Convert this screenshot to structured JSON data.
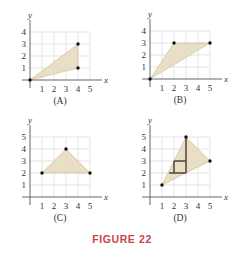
{
  "figure": {
    "caption": "FIGURE 22",
    "colors": {
      "fill": "#e6dcc0",
      "fill_edge": "#c9b88a",
      "grid": "#d8d8d8",
      "axis": "#555555",
      "point": "#111111",
      "inner_lines": "#5a4a3a",
      "caption": "#c8464a"
    },
    "panels": [
      {
        "label": "(A)",
        "origin": [
          30,
          80
        ],
        "grid_x": 5,
        "grid_y": 4,
        "x_ticks": [
          "1",
          "2",
          "3",
          "4",
          "5"
        ],
        "y_ticks": [
          "1",
          "2",
          "3",
          "4"
        ],
        "x_axis_label": "x",
        "y_axis_label": "y",
        "polygon": [
          [
            0,
            0
          ],
          [
            4,
            3
          ],
          [
            4,
            1
          ]
        ],
        "points": [
          [
            0,
            0
          ],
          [
            4,
            3
          ],
          [
            4,
            1
          ]
        ],
        "inner_lines": []
      },
      {
        "label": "(B)",
        "origin": [
          150,
          79
        ],
        "grid_x": 5,
        "grid_y": 4,
        "x_ticks": [
          "1",
          "2",
          "3",
          "4",
          "5"
        ],
        "y_ticks": [
          "1",
          "2",
          "3",
          "4"
        ],
        "x_axis_label": "x",
        "y_axis_label": "y",
        "polygon": [
          [
            0,
            0
          ],
          [
            2,
            3
          ],
          [
            5,
            3
          ]
        ],
        "points": [
          [
            0,
            0
          ],
          [
            2,
            3
          ],
          [
            5,
            3
          ]
        ],
        "inner_lines": []
      },
      {
        "label": "(C)",
        "origin": [
          30,
          197
        ],
        "grid_x": 5,
        "grid_y": 5,
        "x_ticks": [
          "1",
          "2",
          "3",
          "4",
          "5"
        ],
        "y_ticks": [
          "1",
          "2",
          "3",
          "4",
          "5"
        ],
        "x_axis_label": "x",
        "y_axis_label": "y",
        "polygon": [
          [
            1,
            2
          ],
          [
            3,
            4
          ],
          [
            5,
            2
          ]
        ],
        "points": [
          [
            1,
            2
          ],
          [
            3,
            4
          ],
          [
            5,
            2
          ]
        ],
        "inner_lines": []
      },
      {
        "label": "(D)",
        "origin": [
          150,
          197
        ],
        "grid_x": 5,
        "grid_y": 5,
        "x_ticks": [
          "1",
          "2",
          "3",
          "4",
          "5"
        ],
        "y_ticks": [
          "1",
          "2",
          "3",
          "4",
          "5"
        ],
        "x_axis_label": "x",
        "y_axis_label": "y",
        "polygon": [
          [
            1,
            1
          ],
          [
            3,
            5
          ],
          [
            5,
            3
          ]
        ],
        "points": [
          [
            1,
            1
          ],
          [
            3,
            5
          ],
          [
            5,
            3
          ]
        ],
        "inner_lines": [
          [
            [
              3,
              5
            ],
            [
              3,
              2
            ]
          ],
          [
            [
              2,
              3
            ],
            [
              3,
              3
            ]
          ],
          [
            [
              2,
              3
            ],
            [
              2,
              2
            ]
          ],
          [
            [
              1.6,
              2
            ],
            [
              3,
              2
            ]
          ]
        ]
      }
    ]
  }
}
